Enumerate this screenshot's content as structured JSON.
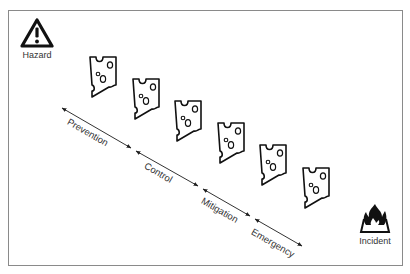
{
  "diagram": {
    "start": {
      "label": "Hazard",
      "icon": "warning-triangle-icon"
    },
    "end": {
      "label": "Incident",
      "icon": "fire-icon"
    },
    "layers_count": 6,
    "stages": [
      {
        "label": "Prevention"
      },
      {
        "label": "Control"
      },
      {
        "label": "Mitigation"
      },
      {
        "label": "Emergency"
      }
    ],
    "colors": {
      "stroke": "#1a1a1a",
      "text": "#333333",
      "frame": "#8a8a8a"
    }
  }
}
